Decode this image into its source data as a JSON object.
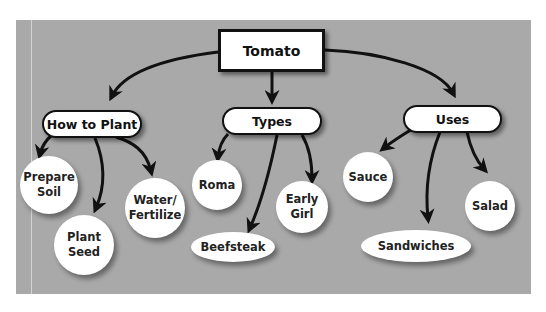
{
  "root": {
    "label": "Tomato"
  },
  "categories": [
    {
      "label": "How to Plant",
      "children": [
        "Prepare\nSoil",
        "Plant\nSeed",
        "Water/\nFertilize"
      ]
    },
    {
      "label": "Types",
      "children": [
        "Roma",
        "Beefsteak",
        "Early\nGirl"
      ]
    },
    {
      "label": "Uses",
      "children": [
        "Sauce",
        "Sandwiches",
        "Salad"
      ]
    }
  ],
  "colors": {
    "panel": "#a9a9a9",
    "node": "#ffffff",
    "line": "#111111"
  }
}
